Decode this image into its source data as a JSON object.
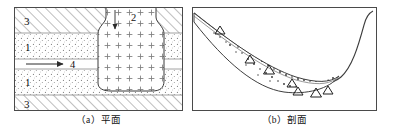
{
  "figure": {
    "panels": [
      {
        "id": "plan",
        "caption": "（a）平面",
        "caption_label": "(a)",
        "caption_text": "平面",
        "labels": [
          {
            "name": "layer-3-top",
            "text": "3"
          },
          {
            "name": "layer-1-upper",
            "text": "1"
          },
          {
            "name": "flow-arrow-4",
            "text": "4"
          },
          {
            "name": "layer-1-lower",
            "text": "1"
          },
          {
            "name": "layer-3-bottom",
            "text": "3"
          },
          {
            "name": "intrusion-2",
            "text": "2"
          }
        ],
        "patterns": {
          "hatch": "diagonal-hatch",
          "dots": "stipple-dots",
          "cross": "plus-symbols"
        }
      },
      {
        "id": "section",
        "caption": "（b）剖面",
        "caption_label": "(b)",
        "caption_text": "剖面",
        "labels": [],
        "patterns": {
          "dots": "stipple-dots",
          "triangles": "open-triangles"
        }
      }
    ],
    "colors": {
      "line": "#333333",
      "frame": "#555555",
      "pattern": "#777777",
      "background": "#ffffff"
    }
  }
}
